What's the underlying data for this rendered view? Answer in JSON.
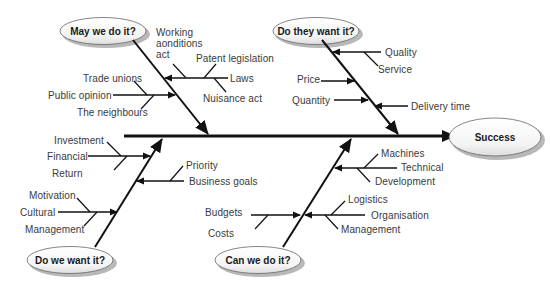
{
  "diagram": {
    "type": "fishbone",
    "effect": "Success",
    "categories": [
      {
        "title": "May we do it?",
        "causes": [
          {
            "label": "Working aonditions act",
            "lines": [
              "Working",
              "aonditions",
              "act"
            ]
          },
          {
            "label": "Laws",
            "subcauses": [
              "Patent legislation",
              "Nuisance act"
            ]
          },
          {
            "label": "Public opinion",
            "subcauses": [
              "Trade unions",
              "The neighbours"
            ]
          }
        ]
      },
      {
        "title": "Do they want it?",
        "causes": [
          {
            "label": "Quality",
            "subcauses": [
              "Service"
            ]
          },
          {
            "label": "Price"
          },
          {
            "label": "Quantity"
          },
          {
            "label": "Delivery time"
          }
        ]
      },
      {
        "title": "Do we want it?",
        "causes": [
          {
            "label": "Financial",
            "subcauses": [
              "Investment",
              "Return"
            ]
          },
          {
            "label": "Business goals",
            "subcauses": [
              "Priority"
            ]
          },
          {
            "label": "Cultural",
            "subcauses": [
              "Motivation",
              "Management"
            ]
          }
        ]
      },
      {
        "title": "Can we do it?",
        "causes": [
          {
            "label": "Technical",
            "subcauses": [
              "Machines",
              "Development"
            ]
          },
          {
            "label": "Budgets",
            "subcauses": [
              "Costs"
            ]
          },
          {
            "label": "Organisation",
            "subcauses": [
              "Logistics",
              "Management"
            ]
          }
        ]
      }
    ]
  },
  "labels": {
    "success": "Success",
    "may": "May we do it?",
    "dothey": "Do they want it?",
    "dowe": "Do we want it?",
    "canwe": "Can we do it?",
    "working1": "Working",
    "working2": "aonditions",
    "working3": "act",
    "patent": "Patent legislation",
    "laws": "Laws",
    "nuisance": "Nuisance act",
    "trade": "Trade unions",
    "public": "Public opinion",
    "neighbours": "The neighbours",
    "quality": "Quality",
    "service": "Service",
    "price": "Price",
    "quantity": "Quantity",
    "delivery": "Delivery time",
    "investment": "Investment",
    "financial": "Financial",
    "return": "Return",
    "priority": "Priority",
    "business": "Business goals",
    "motivation": "Motivation",
    "cultural": "Cultural",
    "management1": "Management",
    "budgets": "Budgets",
    "costs": "Costs",
    "machines": "Machines",
    "technical": "Technical",
    "development": "Development",
    "logistics": "Logistics",
    "organisation": "Organisation",
    "management2": "Management"
  },
  "colors": {
    "line": "#111111",
    "text": "#3a3a3a",
    "ellipse_fill": "#ffffff",
    "ellipse_shadow": "#b8b8b8"
  }
}
